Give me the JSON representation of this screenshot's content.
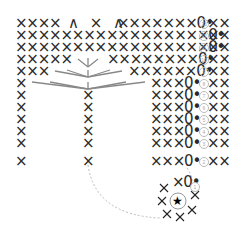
{
  "diagram": {
    "type": "crochet-chart",
    "legend_title": "",
    "rows": [
      {
        "num": "13",
        "circled": "⑬",
        "left": "××××",
        "mid": "∧ × ∧",
        "right": "×××××××0•",
        "after": "××"
      },
      {
        "num": "12",
        "circled": "⑫",
        "left": "×××××××××××××××××0•",
        "after": "××"
      },
      {
        "num": "11",
        "circled": "⑪",
        "left": "×××××××××××××××××0•",
        "after": "××"
      },
      {
        "num": "10",
        "circled": "⑩",
        "left": "×××××",
        "right": "××××××××0•",
        "after": "××"
      },
      {
        "num": "9",
        "circled": "⑨",
        "left": "×××",
        "right": "××××××0•",
        "after": "××"
      },
      {
        "num": "8",
        "circled": "⑧",
        "left": "×",
        "right": "×××0•",
        "after": "××"
      },
      {
        "num": "7",
        "circled": "⑦",
        "left": "×",
        "center": "×",
        "right": "×××0•",
        "after": "××"
      },
      {
        "num": "6",
        "circled": "⑥",
        "left": "×",
        "center": "×",
        "right": "×××0•",
        "after": "××"
      },
      {
        "num": "5",
        "circled": "⑤",
        "left": "×",
        "center": "×",
        "right": "×××0•",
        "after": "××"
      },
      {
        "num": "4",
        "circled": "④",
        "left": "×",
        "center": "×",
        "right": "×××0•",
        "after": "××"
      },
      {
        "num": "3",
        "circled": "③",
        "left": "×",
        "center": "×",
        "right": "×××0•",
        "after": "××"
      },
      {
        "num": "2",
        "circled": "②",
        "left": "×",
        "center": "×",
        "right": "×××0•",
        "after": "××"
      },
      {
        "num": "1",
        "circled": "①",
        "right": "×0•"
      }
    ],
    "center_symbol": "★",
    "symbols": {
      "single_crochet": "×",
      "decrease": "∧",
      "chain": "0",
      "slip_stitch": "•",
      "magic_ring": "★"
    }
  }
}
